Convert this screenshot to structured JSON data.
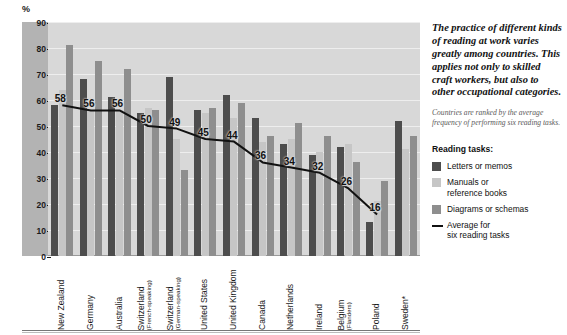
{
  "chart_data": {
    "type": "bar",
    "title": "",
    "xlabel": "",
    "ylabel": "%",
    "ylim": [
      0,
      90
    ],
    "yticks": [
      0,
      10,
      20,
      30,
      40,
      50,
      60,
      70,
      80,
      90
    ],
    "grid": true,
    "legend_position": "right",
    "categories": [
      "New Zealand",
      "Germany",
      "Australia",
      "Switzerland",
      "Switzerland",
      "United States",
      "United Kingdom",
      "Canada",
      "Netherlands",
      "Ireland",
      "Belgium",
      "Poland",
      "Sweden*"
    ],
    "category_subs": [
      "",
      "",
      "",
      "(French-speaking)",
      "(German-speaking)",
      "",
      "",
      "",
      "",
      "",
      "(Flanders)",
      "",
      ""
    ],
    "series": [
      {
        "name": "Letters or memos",
        "color": "#4d4d4d",
        "values": [
          58,
          68,
          61,
          55,
          69,
          56,
          62,
          53,
          43,
          39,
          42,
          13,
          52
        ]
      },
      {
        "name": "Manuals or reference books",
        "color": "#c6c6c6",
        "values": [
          64,
          56,
          56,
          57,
          45,
          55,
          53,
          44,
          45,
          40,
          43,
          21,
          41
        ]
      },
      {
        "name": "Diagrams or schemas",
        "color": "#8e8e8e",
        "values": [
          81,
          75,
          72,
          56,
          33,
          57,
          59,
          46,
          51,
          46,
          36,
          29,
          46
        ]
      }
    ],
    "average_line": {
      "name": "Average for six reading tasks",
      "color": "#111111",
      "values": [
        58,
        56,
        56,
        50,
        49,
        45,
        44,
        36,
        34,
        32,
        26,
        16,
        null
      ],
      "labels": [
        58,
        56,
        56,
        50,
        49,
        45,
        44,
        36,
        34,
        32,
        26,
        16
      ]
    },
    "annotations": {
      "callout": "The practice of different kinds of reading at work varies greatly among countries. This applies not only to skilled craft workers, but also to other occupational categories.",
      "note": "Countries are ranked by the average frequency of performing six reading tasks."
    }
  },
  "axis": {
    "unit_label": "%"
  },
  "legend": {
    "title": "Reading tasks:",
    "items": [
      {
        "label": "Letters or memos",
        "label2": "",
        "kind": "swatch",
        "tone": "s0"
      },
      {
        "label": "Manuals or",
        "label2": "reference books",
        "kind": "swatch",
        "tone": "s1"
      },
      {
        "label": "Diagrams or schemas",
        "label2": "",
        "kind": "swatch",
        "tone": "s2"
      },
      {
        "label": "Average for",
        "label2": "six reading tasks",
        "kind": "line",
        "tone": "line"
      }
    ]
  },
  "colors": {
    "series_dark": "#4d4d4d",
    "series_light": "#c6c6c6",
    "series_mid": "#8e8e8e",
    "plot_bg": "#d8d8d8",
    "axis_bg": "#b3b3b3",
    "line": "#111111"
  }
}
